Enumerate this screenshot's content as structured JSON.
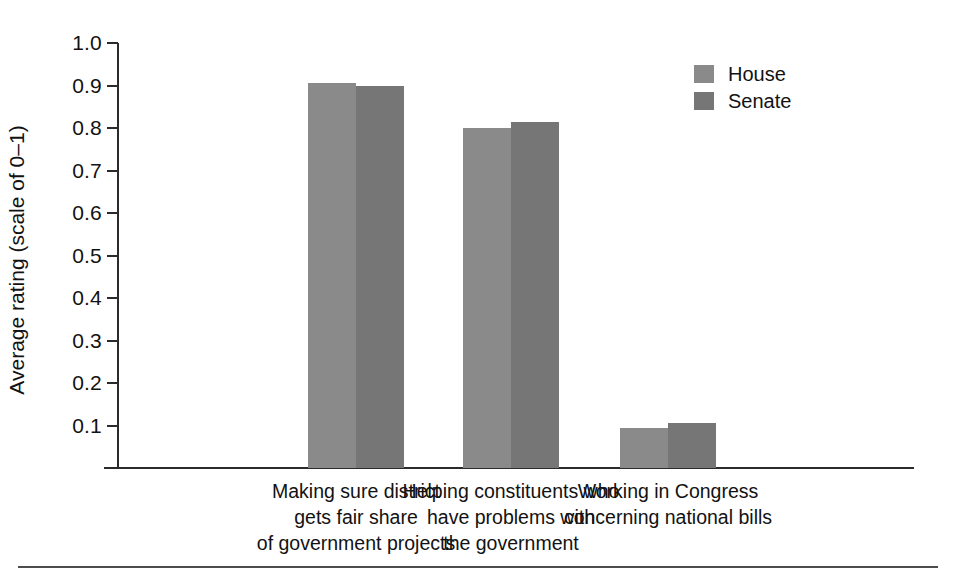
{
  "chart_data": {
    "type": "bar",
    "title": "",
    "xlabel": "",
    "ylabel": "Average rating (scale of 0–1)",
    "ylim": [
      0,
      1.0
    ],
    "grid": false,
    "legend_position": "top-right",
    "y_ticks": [
      "1.0",
      "0.9",
      "0.8",
      "0.7",
      "0.6",
      "0.5",
      "0.4",
      "0.3",
      "0.2",
      "0.1"
    ],
    "y_tick_values": [
      1.0,
      0.9,
      0.8,
      0.7,
      0.6,
      0.5,
      0.4,
      0.3,
      0.2,
      0.1
    ],
    "categories": [
      "Making sure district gets fair share of government projects",
      "Helping constituents who have problems with the government",
      "Working in Congress concerning national bills"
    ],
    "category_lines": [
      [
        "Making sure district",
        "gets fair share",
        "of government projects"
      ],
      [
        "Helping constituents who",
        "have problems with",
        "the government"
      ],
      [
        "Working in Congress",
        "concerning national bills"
      ]
    ],
    "series": [
      {
        "name": "House",
        "color": "#8a8a8a",
        "values": [
          0.905,
          0.8,
          0.095
        ]
      },
      {
        "name": "Senate",
        "color": "#767676",
        "values": [
          0.9,
          0.815,
          0.105
        ]
      }
    ]
  },
  "legend": {
    "items": [
      {
        "label": "House",
        "color": "#8a8a8a"
      },
      {
        "label": "Senate",
        "color": "#767676"
      }
    ]
  },
  "axis": {
    "line_color": "#2b2b2b",
    "text_color": "#121212"
  },
  "rule": {
    "color": "#4d4d4d"
  }
}
